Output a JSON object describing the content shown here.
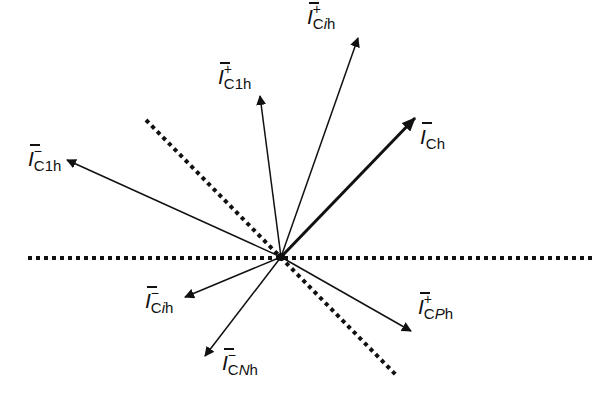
{
  "diagram": {
    "colors": {
      "stroke": "#111111",
      "background": "#ffffff"
    },
    "reference_lines": [
      {
        "name": "horizontal-reference",
        "style": "dotted",
        "angle_deg": 0
      },
      {
        "name": "diagonal-reference",
        "style": "dotted",
        "angle_deg": -45
      }
    ],
    "phasors": [
      {
        "id": "I_Cih_plus",
        "base": "I",
        "sub": "C",
        "sub_italic": "i",
        "sub_tail": "h",
        "sup": "+",
        "emphasis": false
      },
      {
        "id": "I_C1h_plus",
        "base": "I",
        "sub": "C1h",
        "sub_italic": "",
        "sub_tail": "",
        "sup": "+",
        "emphasis": false
      },
      {
        "id": "I_Ch",
        "base": "I",
        "sub": "Ch",
        "sub_italic": "",
        "sub_tail": "",
        "sup": "",
        "emphasis": true
      },
      {
        "id": "I_C1h_minus",
        "base": "I",
        "sub": "C1h",
        "sub_italic": "",
        "sub_tail": "",
        "sup": "−",
        "emphasis": false
      },
      {
        "id": "I_Cih_minus",
        "base": "I",
        "sub": "C",
        "sub_italic": "i",
        "sub_tail": "h",
        "sup": "−",
        "emphasis": false
      },
      {
        "id": "I_CNh_minus",
        "base": "I",
        "sub": "C",
        "sub_italic": "N",
        "sub_tail": "h",
        "sup": "−",
        "emphasis": false
      },
      {
        "id": "I_CPh_plus",
        "base": "I",
        "sub": "C",
        "sub_italic": "P",
        "sub_tail": "h",
        "sup": "+",
        "emphasis": false
      }
    ]
  }
}
